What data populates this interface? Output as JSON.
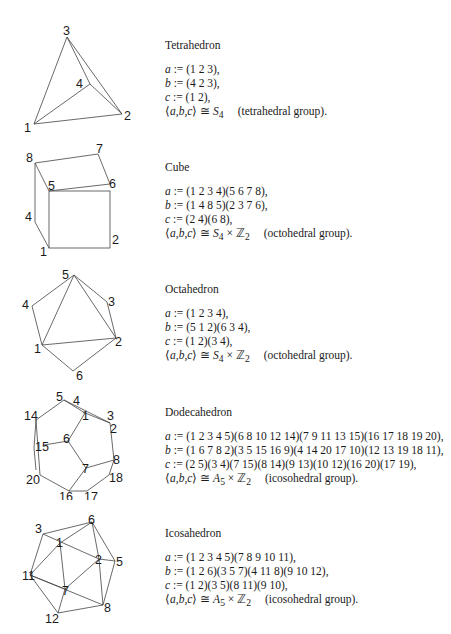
{
  "solids": [
    {
      "name": "Tetrahedron",
      "a": "(1 2 3),",
      "b": "(4 2 3),",
      "c": "(1 2),",
      "group_iso": "S",
      "group_sub": "4",
      "group_extra": "",
      "group_name": "(tetrahedral group).",
      "labels": [
        "1",
        "2",
        "3",
        "4"
      ]
    },
    {
      "name": "Cube",
      "a": "(1 2 3 4)(5 6 7 8),",
      "b": "(1 4 8 5)(2 3 7 6),",
      "c": "(2 4)(6 8),",
      "group_iso": "S",
      "group_sub": "4",
      "group_extra": " × ℤ",
      "group_extra_sub": "2",
      "group_name": "(octohedral group).",
      "labels": [
        "1",
        "2",
        "4",
        "5",
        "6",
        "7",
        "8"
      ]
    },
    {
      "name": "Octahedron",
      "a": "(1 2 3 4),",
      "b": "(5 1 2)(6 3 4),",
      "c": "(1 2)(3 4),",
      "group_iso": "S",
      "group_sub": "4",
      "group_extra": " × ℤ",
      "group_extra_sub": "2",
      "group_name": "(octohedral group).",
      "labels": [
        "1",
        "2",
        "3",
        "4",
        "5",
        "6"
      ]
    },
    {
      "name": "Dodecahedron",
      "a": "(1 2 3 4 5)(6 8 10 12 14)(7 9 11 13 15)(16 17 18 19 20),",
      "b": "(1 6 7 8 2)(3 5 15 16 9)(4 14 20 17 10)(12 13 19 18 11),",
      "c": "(2 5)(3 4)(7 15)(8 14)(9 13)(10 12)(16 20)(17 19),",
      "group_iso": "A",
      "group_sub": "5",
      "group_extra": " × ℤ",
      "group_extra_sub": "2",
      "group_name": "(icosohedral group).",
      "labels": [
        "1",
        "2",
        "3",
        "4",
        "5",
        "6",
        "7",
        "8",
        "14",
        "15",
        "16",
        "17",
        "18",
        "20"
      ]
    },
    {
      "name": "Icosahedron",
      "a": "(1 2 3 4 5)(7 8 9 10 11),",
      "b": "(1 2 6)(3 5 7)(4 11 8)(9 10 12),",
      "c": "(1 2)(3 5)(8 11)(9 10),",
      "group_iso": "A",
      "group_sub": "5",
      "group_extra": " × ℤ",
      "group_extra_sub": "2",
      "group_name": "(icosohedral group).",
      "labels": [
        "1",
        "2",
        "3",
        "5",
        "6",
        "7",
        "8",
        "11",
        "12"
      ]
    }
  ],
  "symbols": {
    "def": " := ",
    "gen_open": "⟨",
    "gen_body": "a,b,c",
    "gen_close": "⟩",
    "iso": " ≅ ",
    "var_a": "a",
    "var_b": "b",
    "var_c": "c"
  }
}
